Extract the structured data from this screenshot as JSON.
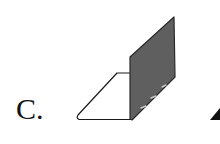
{
  "option": {
    "label": "C."
  },
  "figure": {
    "colors": {
      "base_fill": "#ffffff",
      "panel_fill": "#5f5f5f",
      "stroke": "#1a1a1a",
      "dash": "#bfbfbf",
      "next_option_fill": "#111111"
    }
  }
}
